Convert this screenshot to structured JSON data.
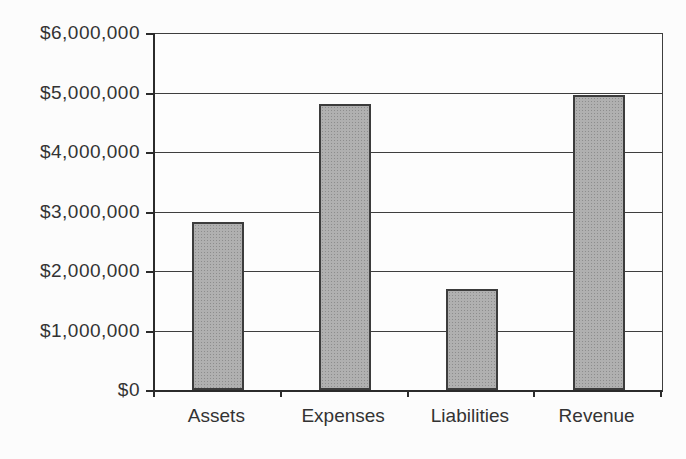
{
  "page": {
    "background": "#fcfcfc"
  },
  "chart_data": {
    "type": "bar",
    "title": "",
    "xlabel": "",
    "ylabel": "",
    "categories": [
      "Assets",
      "Expenses",
      "Liabilities",
      "Revenue"
    ],
    "values": [
      2820000,
      4810000,
      1700000,
      4960000
    ],
    "ylim": [
      0,
      6000000
    ],
    "y_ticks": [
      0,
      1000000,
      2000000,
      3000000,
      4000000,
      5000000,
      6000000
    ],
    "y_tick_labels": [
      "$0",
      "$1,000,000",
      "$2,000,000",
      "$3,000,000",
      "$4,000,000",
      "$5,000,000",
      "$6,000,000"
    ],
    "grid": "horizontal",
    "legend": "none",
    "colors": {
      "bar_fill": "#b0b0b0",
      "bar_dot": "#8d8d8d",
      "bar_border": "#3c3c3c",
      "gridline": "#3e3e3e",
      "axis": "#2b2b2b",
      "text": "#333333",
      "background": "#fcfcfc"
    }
  }
}
